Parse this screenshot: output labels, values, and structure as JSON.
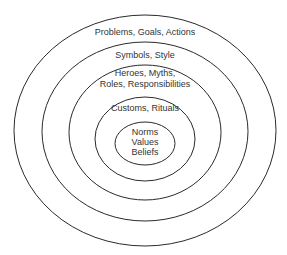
{
  "diagram": {
    "type": "concentric-ellipses",
    "colors": {
      "background": "#ffffff",
      "stroke": "#2a2a2a",
      "text": "#333333"
    },
    "layers": [
      {
        "id": "outer",
        "lines": [
          "Problems, Goals, Actions"
        ]
      },
      {
        "id": "ring2",
        "lines": [
          "Symbols, Style"
        ]
      },
      {
        "id": "ring3",
        "lines": [
          "Heroes, Myths,",
          "Roles, Responsibilities"
        ]
      },
      {
        "id": "ring4",
        "lines": [
          "Customs, Rituals"
        ]
      },
      {
        "id": "core",
        "lines": [
          "Norms",
          "Values",
          "Beliefs"
        ]
      }
    ]
  }
}
